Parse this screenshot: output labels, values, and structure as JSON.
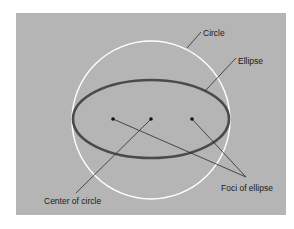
{
  "diagram": {
    "type": "geometry",
    "background_color": "#ffffff",
    "panel_color": "#b5b5b5",
    "circle": {
      "label": "Circle",
      "stroke": "#ffffff",
      "cx": 151,
      "cy": 120,
      "r": 79
    },
    "ellipse": {
      "label": "Ellipse",
      "stroke": "#4a4a4a",
      "cx": 151,
      "cy": 119,
      "rx": 78,
      "ry": 39
    },
    "points": [
      {
        "name": "left-focus",
        "x": 113,
        "y": 119
      },
      {
        "name": "center",
        "x": 151,
        "y": 119
      },
      {
        "name": "right-focus",
        "x": 192,
        "y": 119
      }
    ],
    "labels": {
      "circle": "Circle",
      "ellipse": "Ellipse",
      "foci": "Foci of ellipse",
      "center": "Center of circle"
    }
  }
}
